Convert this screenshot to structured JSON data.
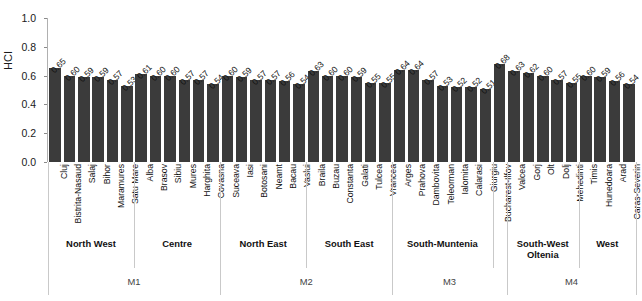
{
  "axis": {
    "ylabel": "HCI",
    "yticks": [
      "1.0",
      "0.8",
      "0.6",
      "0.4",
      "0.2",
      "0.0"
    ]
  },
  "chart_data": {
    "type": "bar",
    "title": "",
    "xlabel": "",
    "ylabel": "HCI",
    "ylim": [
      0.0,
      1.0
    ],
    "grid": false,
    "legend": null,
    "categories": [
      "Cluj",
      "Bistrita-Nasaud",
      "Salaj",
      "Bihor",
      "Maramures",
      "Satu Mare",
      "Alba",
      "Brasov",
      "Sibiu",
      "Mures",
      "Harghita",
      "Covasna",
      "Suceava",
      "Iasi",
      "Botosani",
      "Neamt",
      "Bacau",
      "Vaslui",
      "Braila",
      "Buzau",
      "Constanta",
      "Galati",
      "Tulcea",
      "Vrancea",
      "Arges",
      "Prahova",
      "Dambovita",
      "Teleorman",
      "Ialomita",
      "Calarasi",
      "Giurgiu",
      "Bucharest-Ilfov",
      "Valcea",
      "Gorj",
      "Olt",
      "Dolj",
      "Mehedinti",
      "Timis",
      "Hunedoara",
      "Arad",
      "Caras-Severin"
    ],
    "values": [
      0.65,
      0.6,
      0.59,
      0.59,
      0.57,
      0.53,
      0.61,
      0.6,
      0.6,
      0.57,
      0.57,
      0.54,
      0.6,
      0.59,
      0.57,
      0.57,
      0.56,
      0.54,
      0.63,
      0.6,
      0.6,
      0.59,
      0.55,
      0.55,
      0.64,
      0.64,
      0.57,
      0.53,
      0.52,
      0.52,
      0.51,
      0.68,
      0.63,
      0.62,
      0.6,
      0.57,
      0.55,
      0.6,
      0.59,
      0.56,
      0.54
    ],
    "value_labels": [
      "0.65",
      "0.60",
      "0.59",
      "0.59",
      "0.57",
      "0.53",
      "0.61",
      "0.60",
      "0.60",
      "0.57",
      "0.57",
      "0.54",
      "0.60",
      "0.59",
      "0.57",
      "0.57",
      "0.56",
      "0.54",
      "0.63",
      "0.60",
      "0.60",
      "0.59",
      "0.55",
      "0.55",
      "0.64",
      "0.64",
      "0.57",
      "0.53",
      "0.52",
      "0.52",
      "0.51",
      "0.68",
      "0.63",
      "0.62",
      "0.60",
      "0.57",
      "0.55",
      "0.60",
      "0.59",
      "0.56",
      "0.54"
    ],
    "bar_color": "#3b3b3b",
    "regions": [
      {
        "label": "North West",
        "start": 0,
        "count": 6
      },
      {
        "label": "Centre",
        "start": 6,
        "count": 6
      },
      {
        "label": "North East",
        "start": 12,
        "count": 6
      },
      {
        "label": "South East",
        "start": 18,
        "count": 6
      },
      {
        "label": "South-Muntenia",
        "start": 24,
        "count": 7
      },
      {
        "label": "",
        "start": 31,
        "count": 1
      },
      {
        "label": "South-West\nOltenia",
        "start": 32,
        "count": 5
      },
      {
        "label": "West",
        "start": 37,
        "count": 4
      }
    ],
    "macroregions": [
      {
        "label": "M1",
        "start": 0,
        "count": 12
      },
      {
        "label": "M2",
        "start": 12,
        "count": 12
      },
      {
        "label": "M3",
        "start": 24,
        "count": 8
      },
      {
        "label": "M4",
        "start": 32,
        "count": 9
      }
    ]
  }
}
